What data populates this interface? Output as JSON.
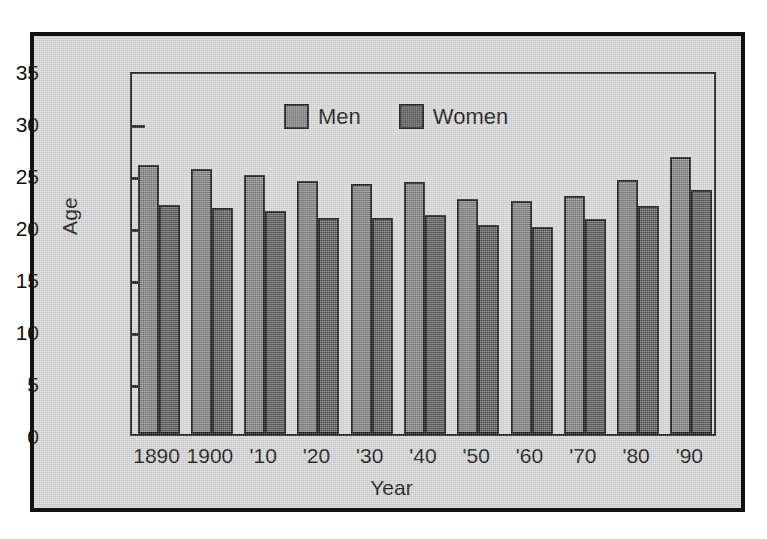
{
  "chart_data": {
    "type": "bar",
    "title": "",
    "xlabel": "Year",
    "ylabel": "Age",
    "ylim": [
      0,
      35
    ],
    "ytick_step": 5,
    "yticks": [
      0,
      5,
      10,
      15,
      20,
      25,
      30,
      35
    ],
    "grid": false,
    "legend_position": "top-center",
    "categories": [
      "1890",
      "1900",
      "'10",
      "'20",
      "'30",
      "'40",
      "'50",
      "'60",
      "'70",
      "'80",
      "'90"
    ],
    "series": [
      {
        "name": "Men",
        "color": "#7e7e7e",
        "values": [
          25.9,
          25.5,
          24.9,
          24.3,
          24.0,
          24.2,
          22.6,
          22.4,
          22.9,
          24.4,
          26.6
        ]
      },
      {
        "name": "Women",
        "color": "#565656",
        "values": [
          22.0,
          21.7,
          21.4,
          20.8,
          20.8,
          21.1,
          20.1,
          19.9,
          20.7,
          21.9,
          23.5
        ]
      }
    ]
  },
  "axes": {
    "y_title": "Age",
    "x_title": "Year"
  },
  "legend": {
    "entries": [
      {
        "label": "Men",
        "swatch": "men"
      },
      {
        "label": "Women",
        "swatch": "women"
      }
    ]
  }
}
